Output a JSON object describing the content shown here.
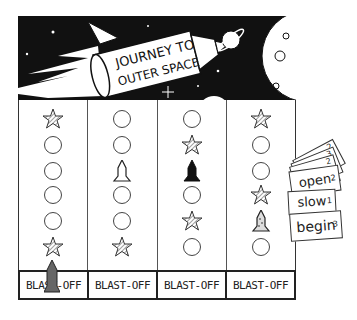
{
  "banner": {
    "title_line1": "JOURNEY TO",
    "title_line2": "OUTER SPACE"
  },
  "board": {
    "columns": [
      {
        "cells": [
          "star",
          "circle",
          "circle",
          "circle",
          "circle",
          "star"
        ],
        "label": "BLAST-OFF",
        "rocket_on_label": true
      },
      {
        "cells": [
          "circle",
          "circle",
          "rocket-white",
          "circle",
          "circle",
          "star"
        ],
        "label": "BLAST-OFF",
        "rocket_on_label": false
      },
      {
        "cells": [
          "circle",
          "star",
          "rocket-black",
          "circle",
          "star",
          "circle"
        ],
        "label": "BLAST-OFF",
        "rocket_on_label": false
      },
      {
        "cells": [
          "star",
          "circle",
          "circle",
          "star",
          "rocket-dotted",
          "circle"
        ],
        "label": "BLAST-OFF",
        "rocket_on_label": false
      }
    ]
  },
  "cards": [
    {
      "word": "",
      "number": "2"
    },
    {
      "word": "",
      "number": "3"
    },
    {
      "word": "",
      "number": "2"
    },
    {
      "word": "open",
      "number": "2"
    },
    {
      "word": "slow",
      "number": "1"
    },
    {
      "word": "begin",
      "number": "3"
    }
  ],
  "colors": {
    "ink": "#111111",
    "paper": "#ffffff"
  }
}
